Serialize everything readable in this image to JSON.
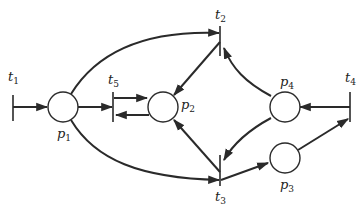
{
  "diagram": {
    "type": "petri-net",
    "places": [
      {
        "id": "p1",
        "label": "p",
        "sub": "1"
      },
      {
        "id": "p2",
        "label": "p",
        "sub": "2"
      },
      {
        "id": "p3",
        "label": "p",
        "sub": "3"
      },
      {
        "id": "p4",
        "label": "p",
        "sub": "4"
      }
    ],
    "transitions": [
      {
        "id": "t1",
        "label": "t",
        "sub": "1"
      },
      {
        "id": "t2",
        "label": "t",
        "sub": "2"
      },
      {
        "id": "t3",
        "label": "t",
        "sub": "3"
      },
      {
        "id": "t4",
        "label": "t",
        "sub": "4"
      },
      {
        "id": "t5",
        "label": "t",
        "sub": "5"
      }
    ],
    "arcs": [
      {
        "from": "t1",
        "to": "p1"
      },
      {
        "from": "p1",
        "to": "t5"
      },
      {
        "from": "p1",
        "to": "t2"
      },
      {
        "from": "p1",
        "to": "t3"
      },
      {
        "from": "t5",
        "to": "p2"
      },
      {
        "from": "p2",
        "to": "t5"
      },
      {
        "from": "t2",
        "to": "p2"
      },
      {
        "from": "t3",
        "to": "p2"
      },
      {
        "from": "p4",
        "to": "t2"
      },
      {
        "from": "p4",
        "to": "t3"
      },
      {
        "from": "t4",
        "to": "p4"
      },
      {
        "from": "t3",
        "to": "p3"
      },
      {
        "from": "p3",
        "to": "t4"
      }
    ],
    "colors": {
      "ink": "#2a2a2a",
      "background": "#ffffff"
    }
  }
}
